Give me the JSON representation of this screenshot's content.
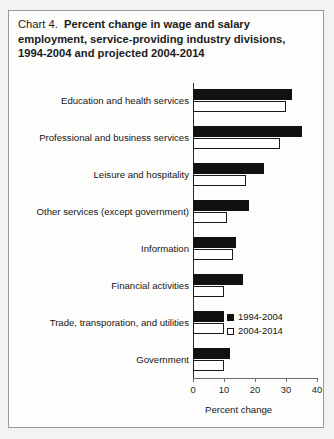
{
  "figure": {
    "label": "Chart 4.",
    "title": "Percent change in wage and salary employment, service-providing industry divisions, 1994-2004 and projected 2004-2014"
  },
  "axis": {
    "x_title": "Percent change",
    "ticks": [
      "0",
      "10",
      "20",
      "30",
      "40"
    ]
  },
  "legend": {
    "items": [
      {
        "label": "1994-2004",
        "swatch": "black"
      },
      {
        "label": "2004-2014",
        "swatch": "white"
      }
    ]
  },
  "chart_data": {
    "type": "bar",
    "orientation": "horizontal",
    "xlabel": "Percent change",
    "ylabel": "",
    "xlim": [
      0,
      40
    ],
    "xticks": [
      0,
      10,
      20,
      30,
      40
    ],
    "grid": false,
    "legend_position": "inside-lower-right",
    "categories": [
      "Education and health services",
      "Professional and business services",
      "Leisure and hospitality",
      "Other services (except government)",
      "Information",
      "Financial activities",
      "Trade, transporation, and utilities",
      "Government"
    ],
    "series": [
      {
        "name": "1994-2004",
        "color": "#111111",
        "values": [
          32,
          35,
          23,
          18,
          14,
          16,
          10,
          12
        ]
      },
      {
        "name": "2004-2014",
        "color": "#ffffff",
        "values": [
          30,
          28,
          17,
          11,
          13,
          10,
          10,
          10
        ]
      }
    ]
  }
}
